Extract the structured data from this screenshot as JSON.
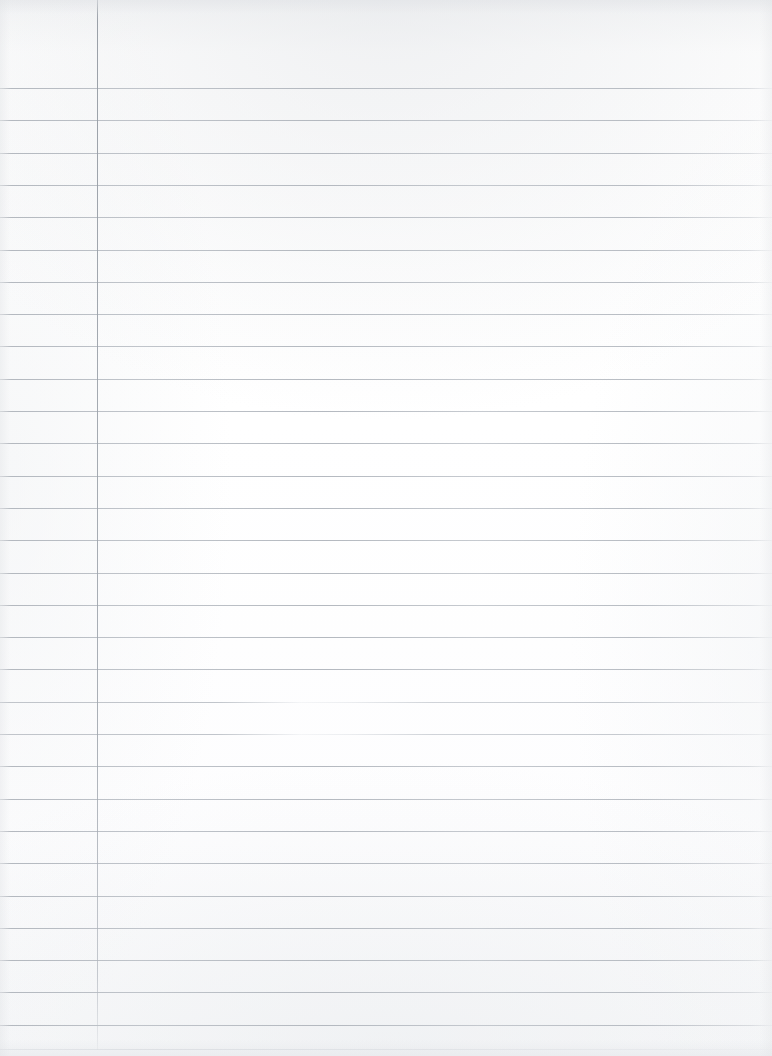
{
  "document": {
    "kind": "scanned-paper",
    "title": "Blank Lined Notebook Page",
    "page_width": 772,
    "page_height": 1056,
    "background_color": "#fdfdfd",
    "content_text": "",
    "handwriting": [],
    "printed_text": [],
    "annotations": []
  },
  "ruling": {
    "type": "wide-ruled-with-margin",
    "rule_color": "#b0b5bc",
    "rule_thickness_px": 1,
    "rule_spacing_px": 32.3,
    "first_rule_y": 88,
    "last_rule_y": 1049,
    "rule_count": 30,
    "rule_start_x": 0,
    "rule_end_x": 772,
    "horizontal_rule_y": [
      88,
      120.3,
      152.6,
      184.9,
      217.2,
      249.5,
      281.8,
      314.1,
      346.4,
      378.7,
      411,
      443.3,
      475.6,
      507.9,
      540.2,
      572.5,
      604.8,
      637.1,
      669.4,
      701.7,
      734,
      766.3,
      798.6,
      830.9,
      863.2,
      895.5,
      927.8,
      960.1,
      992.4,
      1024.7,
      1049
    ],
    "faded_rule_y": [
      701.7,
      734
    ],
    "very_faint_rule_y": [
      1049
    ]
  },
  "margin_rule": {
    "orientation": "vertical",
    "x": 97,
    "y_start": 0,
    "y_end": 1050,
    "color": "#9ca2aa",
    "thickness_px": 1
  }
}
